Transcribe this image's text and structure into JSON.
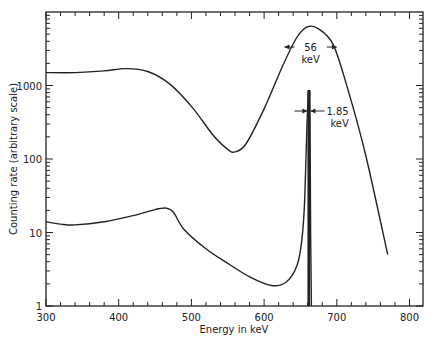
{
  "chart_data": {
    "type": "line",
    "title": "",
    "xlabel": "Energy in keV",
    "ylabel": "Counting rate (arbitrary scale)",
    "xlim": [
      300,
      820
    ],
    "ylim": [
      1,
      10000
    ],
    "yscale": "log",
    "grid": false,
    "x_ticks": [
      300,
      400,
      500,
      600,
      700,
      800
    ],
    "x_tick_labels": [
      "300",
      "400",
      "500",
      "600",
      "700",
      "800"
    ],
    "y_ticks": [
      1,
      10,
      100,
      1000
    ],
    "y_tick_labels": [
      "1",
      "10",
      "100",
      "1000"
    ],
    "series": [
      {
        "name": "broad-peak spectrum (56 keV FWHM)",
        "x": [
          300,
          340,
          380,
          410,
          440,
          470,
          500,
          530,
          550,
          560,
          575,
          600,
          625,
          645,
          660,
          675,
          695,
          715,
          740,
          770
        ],
        "y": [
          1500,
          1500,
          1580,
          1700,
          1550,
          1050,
          520,
          210,
          135,
          125,
          160,
          480,
          1800,
          4500,
          6300,
          5900,
          3600,
          900,
          110,
          5
        ]
      },
      {
        "name": "sharp-peak spectrum (1.85 keV FWHM)",
        "x": [
          300,
          320,
          340,
          380,
          420,
          450,
          465,
          475,
          490,
          520,
          550,
          580,
          610,
          630,
          645,
          652,
          656,
          659,
          661,
          662,
          663,
          664,
          665
        ],
        "y": [
          14,
          13,
          12.7,
          14,
          17,
          20.5,
          21.5,
          19,
          11,
          6,
          3.8,
          2.5,
          1.9,
          2.1,
          3.5,
          8,
          30,
          300,
          850,
          850,
          850,
          10,
          1
        ]
      }
    ],
    "annotations": [
      {
        "text_value": "56",
        "text_unit": "keV",
        "target": "broad peak FWHM",
        "x": 662,
        "y": 3500
      },
      {
        "text_value": "1.85",
        "text_unit": "keV",
        "target": "sharp peak FWHM",
        "x": 662,
        "y": 500
      }
    ]
  }
}
